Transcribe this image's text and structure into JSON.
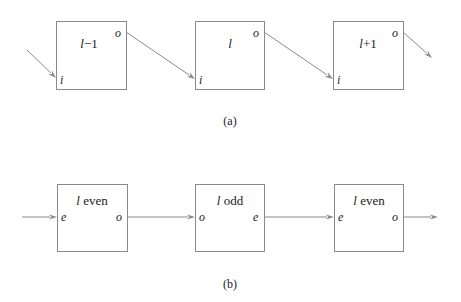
{
  "diagram_a": {
    "caption": "(a)",
    "caption_pos": [
      230,
      125
    ],
    "boxes": [
      {
        "id": "a1",
        "x": 56,
        "y": 21,
        "w": 70,
        "h": 68,
        "title_var": "l",
        "title_suffix": "−1",
        "title_pos": [
          89,
          48
        ],
        "ports": [
          {
            "label": "o",
            "x": 115,
            "y": 37
          },
          {
            "label": "i",
            "x": 60,
            "y": 84
          }
        ]
      },
      {
        "id": "a2",
        "x": 195,
        "y": 21,
        "w": 69,
        "h": 68,
        "title_var": "l",
        "title_suffix": "",
        "title_pos": [
          230,
          48
        ],
        "ports": [
          {
            "label": "o",
            "x": 253,
            "y": 37
          },
          {
            "label": "i",
            "x": 199,
            "y": 84
          }
        ]
      },
      {
        "id": "a3",
        "x": 333,
        "y": 21,
        "w": 70,
        "h": 68,
        "title_var": "l",
        "title_suffix": "+1",
        "title_pos": [
          368,
          48
        ],
        "ports": [
          {
            "label": "o",
            "x": 392,
            "y": 37
          },
          {
            "label": "i",
            "x": 337,
            "y": 84
          }
        ]
      }
    ],
    "edges": [
      {
        "from": "external",
        "to": "a1.i",
        "x1": 27,
        "y1": 50,
        "x2": 56,
        "y2": 78
      },
      {
        "from": "a1.o",
        "to": "a2.i",
        "x1": 126,
        "y1": 32,
        "x2": 195,
        "y2": 79
      },
      {
        "from": "a2.o",
        "to": "a3.i",
        "x1": 264,
        "y1": 32,
        "x2": 333,
        "y2": 79
      },
      {
        "from": "a3.o",
        "to": "external",
        "x1": 403,
        "y1": 32,
        "x2": 432,
        "y2": 58
      }
    ]
  },
  "diagram_b": {
    "caption": "(b)",
    "caption_pos": [
      230,
      288
    ],
    "boxes": [
      {
        "id": "b1",
        "x": 57,
        "y": 184,
        "w": 70,
        "h": 67,
        "title_var": "l",
        "title_suffix": " even",
        "title_pos": [
          92,
          205
        ],
        "ports": [
          {
            "label": "e",
            "x": 61,
            "y": 221
          },
          {
            "label": "o",
            "x": 116,
            "y": 221
          }
        ]
      },
      {
        "id": "b2",
        "x": 195,
        "y": 184,
        "w": 69,
        "h": 67,
        "title_var": "l",
        "title_suffix": " odd",
        "title_pos": [
          230,
          205
        ],
        "ports": [
          {
            "label": "o",
            "x": 199,
            "y": 221
          },
          {
            "label": "e",
            "x": 253,
            "y": 221
          }
        ]
      },
      {
        "id": "b3",
        "x": 334,
        "y": 184,
        "w": 69,
        "h": 67,
        "title_var": "l",
        "title_suffix": " even",
        "title_pos": [
          369,
          205
        ],
        "ports": [
          {
            "label": "e",
            "x": 338,
            "y": 221
          },
          {
            "label": "o",
            "x": 392,
            "y": 221
          }
        ]
      }
    ],
    "edges": [
      {
        "from": "external",
        "to": "b1.e",
        "x1": 22,
        "y1": 217,
        "x2": 57,
        "y2": 217
      },
      {
        "from": "b1.o",
        "to": "b2.o",
        "x1": 127,
        "y1": 217,
        "x2": 195,
        "y2": 217
      },
      {
        "from": "b2.e",
        "to": "b3.e",
        "x1": 264,
        "y1": 217,
        "x2": 334,
        "y2": 217
      },
      {
        "from": "b3.o",
        "to": "external",
        "x1": 403,
        "y1": 217,
        "x2": 438,
        "y2": 217
      }
    ]
  },
  "colors": {
    "stroke": "#8a8a8a",
    "text": "#222222",
    "background": "#ffffff"
  }
}
